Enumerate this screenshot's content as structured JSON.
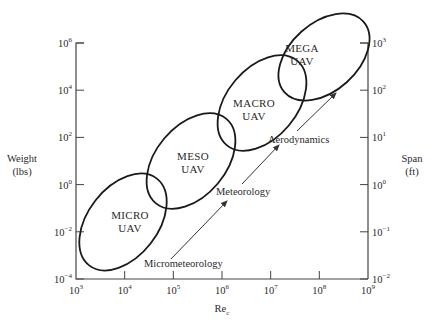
{
  "diagram": {
    "type": "uav-classification",
    "x_axis": {
      "title": "Re",
      "title_subscript": "c",
      "scale": "log",
      "range_exp": [
        3,
        9
      ],
      "ticks": [
        {
          "base": "10",
          "exp": "3"
        },
        {
          "base": "10",
          "exp": "4"
        },
        {
          "base": "10",
          "exp": "5"
        },
        {
          "base": "10",
          "exp": "6"
        },
        {
          "base": "10",
          "exp": "7"
        },
        {
          "base": "10",
          "exp": "8"
        },
        {
          "base": "10",
          "exp": "9"
        }
      ]
    },
    "left_axis": {
      "title_line1": "Weight",
      "title_line2": "(lbs)",
      "scale": "log",
      "range_exp": [
        -4,
        6
      ],
      "ticks": [
        {
          "base": "10",
          "exp": "6"
        },
        {
          "base": "10",
          "exp": "4"
        },
        {
          "base": "10",
          "exp": "2"
        },
        {
          "base": "10",
          "exp": "0"
        },
        {
          "base": "10",
          "exp": "−2"
        },
        {
          "base": "10",
          "exp": "−4"
        }
      ]
    },
    "right_axis": {
      "title_line1": "Span",
      "title_line2": "(ft)",
      "scale": "log",
      "range_exp": [
        -2,
        3
      ],
      "ticks": [
        {
          "base": "10",
          "exp": "3"
        },
        {
          "base": "10",
          "exp": "2"
        },
        {
          "base": "10",
          "exp": "1"
        },
        {
          "base": "10",
          "exp": "0"
        },
        {
          "base": "10",
          "exp": "−1"
        },
        {
          "base": "10",
          "exp": "−2"
        }
      ]
    },
    "regions": [
      {
        "name": "micro",
        "line1": "MICRO",
        "line2": "UAV",
        "re_center_exp": 4.3,
        "weight_center_exp": -1.6
      },
      {
        "name": "meso",
        "line1": "MESO",
        "line2": "UAV",
        "re_center_exp": 5.3,
        "weight_center_exp": 0.9
      },
      {
        "name": "macro",
        "line1": "MACRO",
        "line2": "UAV",
        "re_center_exp": 6.3,
        "weight_center_exp": 3.2
      },
      {
        "name": "mega",
        "line1": "MEGA",
        "line2": "UAV",
        "re_center_exp": 7.6,
        "weight_center_exp": 5.3
      }
    ],
    "arrows": [
      {
        "name": "micrometeorology",
        "label": "Micrometeorology"
      },
      {
        "name": "meteorology",
        "label": "Meteorology"
      },
      {
        "name": "aerodynamics",
        "label": "Aerodynamics"
      }
    ]
  }
}
